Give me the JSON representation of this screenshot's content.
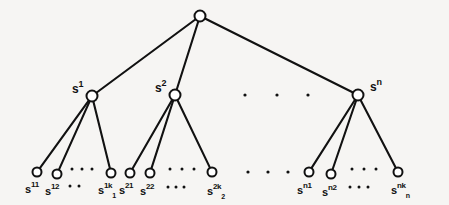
{
  "figure": {
    "kind": "tree-diagram",
    "title": "",
    "background_color": "#f6f5f3",
    "stroke_color": "#111111",
    "node_fill_color": "#ffffff"
  },
  "nodes": {
    "root": {
      "id": "root",
      "label": "",
      "x": 200,
      "y": 16,
      "r": 5.5
    },
    "level1": [
      {
        "id": "s1",
        "label_base": "s",
        "label_sup": "1",
        "x": 92,
        "y": 96,
        "r": 5.5,
        "label_x": 72,
        "label_y": 80
      },
      {
        "id": "s2",
        "label_base": "s",
        "label_sup": "2",
        "x": 175,
        "y": 95,
        "r": 5.5,
        "label_x": 155,
        "label_y": 79
      },
      {
        "id": "sn",
        "label_base": "s",
        "label_sup": "n",
        "x": 358,
        "y": 95,
        "r": 5.5,
        "label_x": 370,
        "label_y": 78
      }
    ],
    "leaves": [
      {
        "id": "s11",
        "label_base": "s",
        "label_sup": "11",
        "label_sub": "",
        "x": 37,
        "y": 172,
        "r": 4.5,
        "label_x": 25,
        "label_y": 180
      },
      {
        "id": "s12",
        "label_base": "s",
        "label_sup": "12",
        "label_sub": "",
        "x": 57,
        "y": 174,
        "r": 4.5,
        "label_x": 45,
        "label_y": 182
      },
      {
        "id": "s1k1",
        "label_base": "s",
        "label_sup": "1k",
        "label_sub": "1",
        "x": 111,
        "y": 173,
        "r": 4.5,
        "label_x": 98,
        "label_y": 181
      },
      {
        "id": "s21",
        "label_base": "s",
        "label_sup": "21",
        "label_sub": "",
        "x": 130,
        "y": 173,
        "r": 4.5,
        "label_x": 119,
        "label_y": 181
      },
      {
        "id": "s22",
        "label_base": "s",
        "label_sup": "22",
        "label_sub": "",
        "x": 150,
        "y": 173,
        "r": 4.5,
        "label_x": 140,
        "label_y": 182
      },
      {
        "id": "s2k2",
        "label_base": "s",
        "label_sup": "2k",
        "label_sub": "2",
        "x": 212,
        "y": 172,
        "r": 4.5,
        "label_x": 207,
        "label_y": 182
      },
      {
        "id": "sn1",
        "label_base": "s",
        "label_sup": "n1",
        "label_sub": "",
        "x": 309,
        "y": 172,
        "r": 4.5,
        "label_x": 297,
        "label_y": 181
      },
      {
        "id": "sn2",
        "label_base": "s",
        "label_sup": "n2",
        "label_sub": "",
        "x": 331,
        "y": 174,
        "r": 4.5,
        "label_x": 322,
        "label_y": 183
      },
      {
        "id": "snkn",
        "label_base": "s",
        "label_sup": "nk",
        "label_sub": "n",
        "x": 398,
        "y": 172,
        "r": 4.5,
        "label_x": 391,
        "label_y": 181
      }
    ]
  },
  "edges": [
    {
      "from": "root",
      "to": "s1",
      "x1": 200,
      "y1": 16,
      "x2": 92,
      "y2": 96
    },
    {
      "from": "root",
      "to": "s2",
      "x1": 200,
      "y1": 16,
      "x2": 175,
      "y2": 95
    },
    {
      "from": "root",
      "to": "sn",
      "x1": 200,
      "y1": 16,
      "x2": 358,
      "y2": 95
    },
    {
      "from": "s1",
      "to": "s11",
      "x1": 92,
      "y1": 96,
      "x2": 37,
      "y2": 172
    },
    {
      "from": "s1",
      "to": "s12",
      "x1": 92,
      "y1": 96,
      "x2": 57,
      "y2": 174
    },
    {
      "from": "s1",
      "to": "s1k1",
      "x1": 92,
      "y1": 96,
      "x2": 111,
      "y2": 173
    },
    {
      "from": "s2",
      "to": "s21",
      "x1": 175,
      "y1": 95,
      "x2": 130,
      "y2": 173
    },
    {
      "from": "s2",
      "to": "s22",
      "x1": 175,
      "y1": 95,
      "x2": 150,
      "y2": 173
    },
    {
      "from": "s2",
      "to": "s2k2",
      "x1": 175,
      "y1": 95,
      "x2": 212,
      "y2": 172
    },
    {
      "from": "sn",
      "to": "sn1",
      "x1": 358,
      "y1": 95,
      "x2": 309,
      "y2": 172
    },
    {
      "from": "sn",
      "to": "sn2",
      "x1": 358,
      "y1": 95,
      "x2": 331,
      "y2": 174
    },
    {
      "from": "sn",
      "to": "snkn",
      "x1": 358,
      "y1": 95,
      "x2": 398,
      "y2": 172
    }
  ],
  "ellipses": [
    {
      "id": "ellipsis-level1-mid",
      "glyph": ".",
      "dots": [
        {
          "x": 245,
          "y": 95
        },
        {
          "x": 277,
          "y": 95
        },
        {
          "x": 308,
          "y": 95
        }
      ],
      "r": 1.6
    },
    {
      "id": "ellipsis-leaves-c1",
      "glyph": ".",
      "dots": [
        {
          "x": 72,
          "y": 169
        },
        {
          "x": 82,
          "y": 169
        },
        {
          "x": 92,
          "y": 169
        }
      ],
      "r": 1.5
    },
    {
      "id": "ellipsis-leaves-c1-lower",
      "glyph": ".",
      "dots": [
        {
          "x": 70,
          "y": 186
        },
        {
          "x": 79,
          "y": 186
        }
      ],
      "r": 1.5
    },
    {
      "id": "ellipsis-leaves-c2",
      "glyph": ".",
      "dots": [
        {
          "x": 170,
          "y": 169
        },
        {
          "x": 182,
          "y": 169
        },
        {
          "x": 194,
          "y": 169
        }
      ],
      "r": 1.5
    },
    {
      "id": "ellipsis-leaves-c2-lower",
      "glyph": ".",
      "dots": [
        {
          "x": 168,
          "y": 187
        },
        {
          "x": 176,
          "y": 187
        },
        {
          "x": 184,
          "y": 187
        }
      ],
      "r": 1.5
    },
    {
      "id": "ellipsis-leaves-mid",
      "glyph": ".",
      "dots": [
        {
          "x": 248,
          "y": 172
        },
        {
          "x": 268,
          "y": 172
        },
        {
          "x": 288,
          "y": 172
        }
      ],
      "r": 1.6
    },
    {
      "id": "ellipsis-leaves-c3",
      "glyph": ".",
      "dots": [
        {
          "x": 352,
          "y": 169
        },
        {
          "x": 364,
          "y": 169
        },
        {
          "x": 376,
          "y": 169
        }
      ],
      "r": 1.5
    },
    {
      "id": "ellipsis-leaves-c3-lower",
      "glyph": ".",
      "dots": [
        {
          "x": 350,
          "y": 187
        },
        {
          "x": 359,
          "y": 187
        },
        {
          "x": 368,
          "y": 187
        }
      ],
      "r": 1.5
    }
  ],
  "caption": ""
}
